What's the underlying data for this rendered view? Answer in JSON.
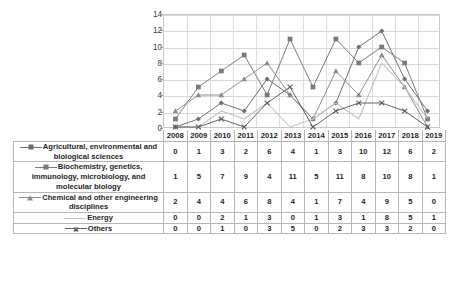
{
  "chart_data": {
    "type": "line",
    "title": "",
    "xlabel": "",
    "ylabel": "",
    "ylim": [
      0,
      14
    ],
    "ytick_step": 2,
    "yticks": [
      0,
      2,
      4,
      6,
      8,
      10,
      12,
      14
    ],
    "grid": true,
    "legend_position": "table-below",
    "categories": [
      "2008",
      "2009",
      "2010",
      "2011",
      "2012",
      "2013",
      "2014",
      "2015",
      "2016",
      "2017",
      "2018",
      "2019"
    ],
    "series": [
      {
        "name": "Agricultural, environmental and biological sciences",
        "marker": "diamond",
        "color": "#6b6f7a",
        "values": [
          0,
          1,
          3,
          2,
          6,
          4,
          1,
          3,
          10,
          12,
          6,
          2
        ]
      },
      {
        "name": "Biochemistry, genetics, immunology, microbiology, and molecular biology",
        "marker": "square",
        "color": "#7a7a7a",
        "values": [
          1,
          5,
          7,
          9,
          4,
          11,
          5,
          11,
          8,
          10,
          8,
          1
        ]
      },
      {
        "name": "Chemical and other engineering disciplines",
        "marker": "triangle",
        "color": "#8d8d8d",
        "values": [
          2,
          4,
          4,
          6,
          8,
          4,
          1,
          7,
          4,
          9,
          5,
          0
        ]
      },
      {
        "name": "Energy",
        "marker": "none",
        "color": "#c2c2c2",
        "values": [
          0,
          0,
          2,
          1,
          3,
          0,
          1,
          3,
          1,
          8,
          5,
          1
        ]
      },
      {
        "name": "Others",
        "marker": "x",
        "color": "#5f5f5f",
        "values": [
          0,
          0,
          1,
          0,
          3,
          5,
          0,
          2,
          3,
          3,
          2,
          0
        ]
      }
    ]
  },
  "table": {
    "corner_label": "",
    "columns": [
      "2008",
      "2009",
      "2010",
      "2011",
      "2012",
      "2013",
      "2014",
      "2015",
      "2016",
      "2017",
      "2018",
      "2019"
    ],
    "rows": [
      {
        "label": "Agricultural, environmental and biological sciences",
        "marker": "diamond",
        "color": "#6b6f7a",
        "values": [
          "0",
          "1",
          "3",
          "2",
          "6",
          "4",
          "1",
          "3",
          "10",
          "12",
          "6",
          "2"
        ]
      },
      {
        "label": "Biochemistry, genetics, immunology, microbiology, and molecular biology",
        "marker": "square",
        "color": "#7a7a7a",
        "values": [
          "1",
          "5",
          "7",
          "9",
          "4",
          "11",
          "5",
          "11",
          "8",
          "10",
          "8",
          "1"
        ]
      },
      {
        "label": "Chemical and other engineering disciplines",
        "marker": "triangle",
        "color": "#8d8d8d",
        "values": [
          "2",
          "4",
          "4",
          "6",
          "8",
          "4",
          "1",
          "7",
          "4",
          "9",
          "5",
          "0"
        ]
      },
      {
        "label": "Energy",
        "marker": "none",
        "color": "#c2c2c2",
        "values": [
          "0",
          "0",
          "2",
          "1",
          "3",
          "0",
          "1",
          "3",
          "1",
          "8",
          "5",
          "1"
        ]
      },
      {
        "label": "Others",
        "marker": "x",
        "color": "#5f5f5f",
        "values": [
          "0",
          "0",
          "1",
          "0",
          "3",
          "5",
          "0",
          "2",
          "3",
          "3",
          "2",
          "0"
        ]
      }
    ]
  },
  "colors": {
    "gridline": "#d8d8d8",
    "plot_border": "#c9c9c9",
    "table_border": "#b6b6b6",
    "text": "#1f1f1f"
  }
}
